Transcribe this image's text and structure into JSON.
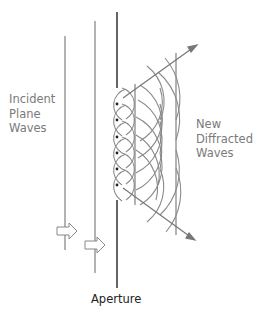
{
  "diagram": {
    "labels": {
      "incident": [
        "Incident",
        "Plane",
        "Waves"
      ],
      "diffracted": [
        "New",
        "Diffracted",
        "Waves"
      ],
      "aperture": "Aperture"
    },
    "elements": {
      "incident_wavefronts": 2,
      "direction_arrows": 2,
      "huygens_sources": 6,
      "diffracted_wavefronts": 2,
      "spread_arrows": 2
    },
    "colors": {
      "line": "#888888",
      "aperture": "#333333",
      "text_gray": "#7a7a7a",
      "text_dark": "#222222"
    }
  }
}
